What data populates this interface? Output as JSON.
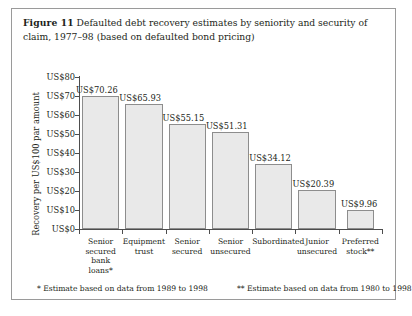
{
  "caption": {
    "figure_label": "Figure 11",
    "text": "Defaulted debt recovery estimates by seniority and security of claim, 1977–98 (based on defaulted bond pricing)"
  },
  "footnotes": {
    "single_asterisk": "* Estimate based on data from 1989 to 1998",
    "double_asterisk": "** Estimate based on data from 1980 to 1998"
  },
  "chart_data": {
    "type": "bar",
    "title": "Defaulted debt recovery estimates by seniority and security of claim, 1977–98 (based on defaulted bond pricing)",
    "xlabel": "",
    "ylabel": "Recovery per US$100 par amount",
    "ylim": [
      0,
      80
    ],
    "ytick_labels": [
      "US$0",
      "US$10",
      "US$20",
      "US$30",
      "US$40",
      "US$50",
      "US$60",
      "US$70",
      "US$80"
    ],
    "ytick_values": [
      0,
      10,
      20,
      30,
      40,
      50,
      60,
      70,
      80
    ],
    "grid": false,
    "legend": "none",
    "categories": [
      "Senior secured bank loans*",
      "Equipment trust",
      "Senior secured",
      "Senior unsecured",
      "Subordinated",
      "Junior unsecured",
      "Preferred stock**"
    ],
    "category_lines": [
      [
        "Senior",
        "secured",
        "bank",
        "loans*"
      ],
      [
        "Equipment",
        "trust"
      ],
      [
        "Senior",
        "secured"
      ],
      [
        "Senior",
        "unsecured"
      ],
      [
        "Subordinated"
      ],
      [
        "Junior",
        "unsecured"
      ],
      [
        "Preferred",
        "stock**"
      ]
    ],
    "values": [
      70.26,
      65.93,
      55.15,
      51.31,
      34.12,
      20.39,
      9.96
    ],
    "value_labels": [
      "US$70.26",
      "US$65.93",
      "US$55.15",
      "US$51.31",
      "US$34.12",
      "US$20.39",
      "US$9.96"
    ],
    "bar_color": "#e9e9e9",
    "bar_border_color": "#8d8d8d",
    "axis_color": "#4d4d4d"
  }
}
